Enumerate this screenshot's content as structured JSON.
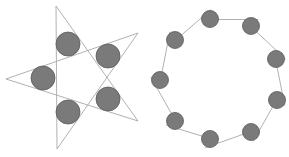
{
  "figures": [
    {
      "id": "five-point-star",
      "description": "Five-pointed star outline with five shaded circles at inner vertices",
      "line_color": "#a8a8a8",
      "circle_fill": "#7a7a7a",
      "circle_stroke": "#5a5a5a",
      "vertices": [
        [
          56,
          6
        ],
        [
          138,
          33
        ],
        [
          138,
          121
        ],
        [
          57,
          149
        ],
        [
          6,
          79
        ]
      ],
      "star_order": [
        0,
        2,
        4,
        1,
        3
      ],
      "circles": [
        {
          "cx": 68,
          "cy": 44,
          "r": 12
        },
        {
          "cx": 108,
          "cy": 56,
          "r": 12
        },
        {
          "cx": 108,
          "cy": 99,
          "r": 12
        },
        {
          "cx": 68,
          "cy": 112,
          "r": 12
        },
        {
          "cx": 43,
          "cy": 78,
          "r": 12
        }
      ]
    },
    {
      "id": "nine-circle-ring",
      "description": "Nine shaded circles arranged around a nonagon with crossing tangent lines",
      "line_color": "#a8a8a8",
      "circle_fill": "#7a7a7a",
      "circle_stroke": "#5a5a5a",
      "circles": [
        {
          "cx": 210,
          "cy": 19,
          "r": 8.5
        },
        {
          "cx": 251,
          "cy": 26,
          "r": 8.5
        },
        {
          "cx": 276,
          "cy": 59,
          "r": 8.5
        },
        {
          "cx": 277,
          "cy": 100,
          "r": 8.5
        },
        {
          "cx": 251,
          "cy": 132,
          "r": 8.5
        },
        {
          "cx": 210,
          "cy": 139,
          "r": 8.5
        },
        {
          "cx": 175,
          "cy": 121,
          "r": 8.5
        },
        {
          "cx": 160,
          "cy": 80,
          "r": 8.5
        },
        {
          "cx": 175,
          "cy": 40,
          "r": 8.5
        }
      ]
    }
  ]
}
